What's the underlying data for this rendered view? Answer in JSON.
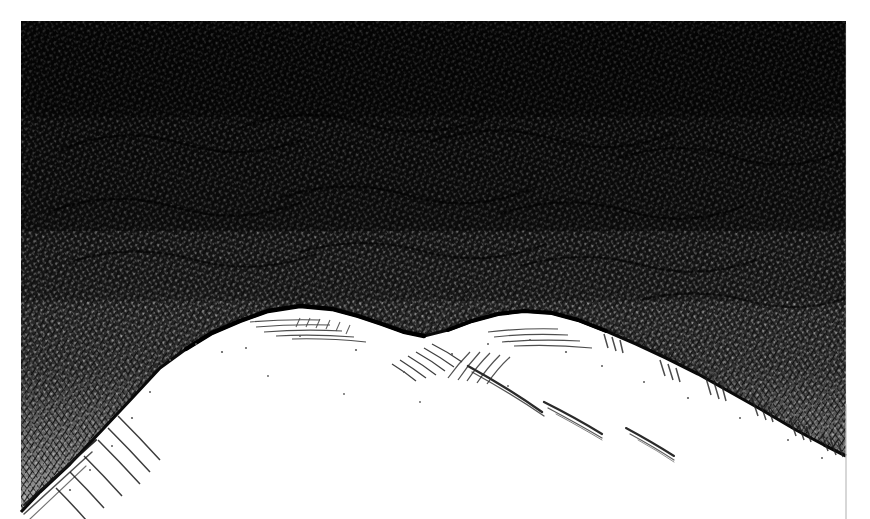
{
  "artwork": {
    "title": "Mountain Ridge Under Dense Night Sky",
    "medium": "pen-and-ink crosshatch drawing",
    "domain_kind": "natural-image",
    "canvas": {
      "width": 870,
      "height": 519,
      "background_color": "#ffffff"
    },
    "plate": {
      "left": 21,
      "top": 21,
      "right": 846,
      "bottom": 519,
      "border_color": "#b9b9b9",
      "border_note": "faint vertical rule visible at right edge below the slope"
    },
    "palette": {
      "ink": "#111111",
      "ink_soft": "#2b2b2b",
      "ink_mid": "#4a4a4a",
      "ink_light": "#7d7d7d",
      "snow": "#ffffff",
      "paper": "#ffffff",
      "halo": "#f2f2f2"
    },
    "regions": [
      {
        "name": "sky",
        "label": "Dense crosshatched sky",
        "tone": "very dark, near solid black at top, lightening to mid grey just above the ridge",
        "texture": "multi-directional short ink strokes leaving tiny white flecks"
      },
      {
        "name": "halo",
        "label": "Luminous band above ridge",
        "tone": "light grey, thinning strokes",
        "texture": "stippled dots and sparse diagonal ticks near the central saddle"
      },
      {
        "name": "snowfield",
        "label": "Snow covered mountain flank",
        "tone": "pure white paper",
        "texture": "sparse thin arc strokes marking ridges and drifts"
      }
    ],
    "ridge_profile": {
      "description": "Silhouette of the snow ridge read left to right across the plate",
      "points": [
        [
          21,
          512
        ],
        [
          40,
          492
        ],
        [
          70,
          464
        ],
        [
          104,
          428
        ],
        [
          134,
          396
        ],
        [
          160,
          368
        ],
        [
          186,
          349
        ],
        [
          212,
          333
        ],
        [
          240,
          321
        ],
        [
          268,
          311
        ],
        [
          300,
          306
        ],
        [
          332,
          309
        ],
        [
          358,
          316
        ],
        [
          382,
          324
        ],
        [
          404,
          332
        ],
        [
          424,
          336
        ],
        [
          448,
          330
        ],
        [
          472,
          321
        ],
        [
          498,
          314
        ],
        [
          524,
          311
        ],
        [
          552,
          313
        ],
        [
          578,
          320
        ],
        [
          606,
          331
        ],
        [
          636,
          344
        ],
        [
          666,
          358
        ],
        [
          698,
          374
        ],
        [
          730,
          392
        ],
        [
          762,
          410
        ],
        [
          796,
          430
        ],
        [
          824,
          445
        ],
        [
          846,
          456
        ]
      ]
    },
    "snow_strokes": {
      "description": "Thin arc hatch lines shading the snow slopes",
      "count": 18
    },
    "stipple": {
      "description": "Dotted light patch where sky texture thins above the saddle",
      "x_range": [
        372,
        476
      ],
      "y_range": [
        292,
        344
      ],
      "dot_count": 46
    }
  },
  "meta": {
    "visible_text": "none — the image contains no lettering, labels or UI text"
  }
}
